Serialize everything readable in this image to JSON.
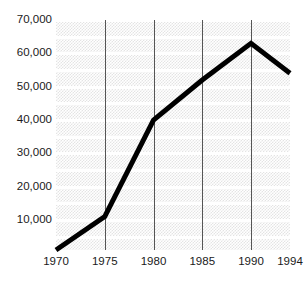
{
  "chart_data": {
    "type": "line",
    "title": "",
    "subtitle": "",
    "xlabel": "",
    "ylabel": "",
    "x": [
      1970,
      1975,
      1980,
      1985,
      1990,
      1994
    ],
    "categories": [
      "1970",
      "1975",
      "1980",
      "1985",
      "1990",
      "1994"
    ],
    "values": [
      1000,
      11000,
      40000,
      52000,
      63000,
      54000
    ],
    "series": [
      {
        "name": "",
        "values": [
          1000,
          11000,
          40000,
          52000,
          63000,
          54000
        ],
        "color": "#000000"
      }
    ],
    "xlim": [
      1970,
      1994
    ],
    "ylim": [
      0,
      70000
    ],
    "y_ticks": [
      70000,
      60000,
      50000,
      40000,
      30000,
      20000,
      10000
    ],
    "y_tick_labels": [
      "70,000",
      "60,000",
      "50,000",
      "40,000",
      "30,000",
      "20,000",
      "10,000"
    ],
    "x_ticks": [
      1970,
      1975,
      1980,
      1985,
      1990,
      1994
    ],
    "x_tick_labels": [
      "1970",
      "1975",
      "1980",
      "1985",
      "1990",
      "1994"
    ],
    "gridlines": {
      "horizontal": true,
      "horizontal_color": "#ffffff",
      "horizontal_interval": 5000,
      "vertical": true,
      "vertical_color": "#555555",
      "vertical_at": [
        1975,
        1980,
        1985,
        1990
      ]
    },
    "legend": {
      "visible": false,
      "position": "none",
      "entries": []
    },
    "plot_background_color": "#e4e4e4",
    "line_color": "#000000",
    "line_width": 5,
    "annotations": []
  },
  "axes": {
    "y_labels": [
      {
        "text": "70,000",
        "value": 70000
      },
      {
        "text": "60,000",
        "value": 60000
      },
      {
        "text": "50,000",
        "value": 50000
      },
      {
        "text": "40,000",
        "value": 40000
      },
      {
        "text": "30,000",
        "value": 30000
      },
      {
        "text": "20,000",
        "value": 20000
      },
      {
        "text": "10,000",
        "value": 10000
      }
    ],
    "x_labels": [
      {
        "text": "1970",
        "value": 1970
      },
      {
        "text": "1975",
        "value": 1975
      },
      {
        "text": "1980",
        "value": 1980
      },
      {
        "text": "1985",
        "value": 1985
      },
      {
        "text": "1990",
        "value": 1990
      },
      {
        "text": "1994",
        "value": 1994
      }
    ]
  }
}
